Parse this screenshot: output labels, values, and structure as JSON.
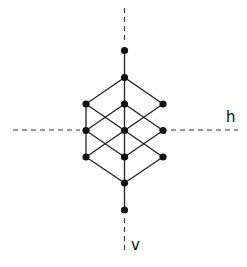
{
  "diagram": {
    "type": "lattice",
    "colors": {
      "edge": "#222222",
      "node": "#111111",
      "axis": "#333333",
      "background": "#ffffff"
    },
    "axes": {
      "horizontal": {
        "label": "h",
        "segments": [
          [
            13,
            130,
            80,
            130
          ],
          [
            171,
            130,
            238,
            130
          ]
        ]
      },
      "vertical": {
        "label": "v",
        "segments": [
          [
            124.5,
            8,
            124.5,
            42
          ],
          [
            124.5,
            218,
            124.5,
            253
          ]
        ]
      }
    },
    "nodes": [
      {
        "id": "n0",
        "x": 124.5,
        "y": 50.5
      },
      {
        "id": "n1",
        "x": 124.5,
        "y": 77.5
      },
      {
        "id": "n2",
        "x": 86,
        "y": 104
      },
      {
        "id": "n3",
        "x": 124.5,
        "y": 104
      },
      {
        "id": "n4",
        "x": 163,
        "y": 104
      },
      {
        "id": "n5",
        "x": 86,
        "y": 130.5
      },
      {
        "id": "n6",
        "x": 124.5,
        "y": 130.5
      },
      {
        "id": "n7",
        "x": 163,
        "y": 130.5
      },
      {
        "id": "n8",
        "x": 86,
        "y": 157
      },
      {
        "id": "n9",
        "x": 124.5,
        "y": 157
      },
      {
        "id": "n10",
        "x": 163,
        "y": 157
      },
      {
        "id": "n11",
        "x": 124.5,
        "y": 183
      },
      {
        "id": "n12",
        "x": 124.5,
        "y": 210
      }
    ],
    "edges": [
      [
        "n0",
        "n1"
      ],
      [
        "n1",
        "n2"
      ],
      [
        "n1",
        "n3"
      ],
      [
        "n1",
        "n4"
      ],
      [
        "n2",
        "n5"
      ],
      [
        "n2",
        "n6"
      ],
      [
        "n3",
        "n5"
      ],
      [
        "n3",
        "n6"
      ],
      [
        "n3",
        "n7"
      ],
      [
        "n4",
        "n6"
      ],
      [
        "n5",
        "n8"
      ],
      [
        "n5",
        "n9"
      ],
      [
        "n6",
        "n8"
      ],
      [
        "n6",
        "n9"
      ],
      [
        "n6",
        "n10"
      ],
      [
        "n7",
        "n9"
      ],
      [
        "n8",
        "n11"
      ],
      [
        "n9",
        "n11"
      ],
      [
        "n10",
        "n11"
      ],
      [
        "n11",
        "n12"
      ]
    ],
    "node_radius": 3.6
  }
}
